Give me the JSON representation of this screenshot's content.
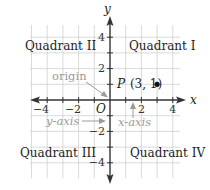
{
  "diagram": {
    "axes": {
      "x_label": "x",
      "y_label": "y",
      "origin_label": "O",
      "x_ticks": [
        {
          "value": -4,
          "label": "−4"
        },
        {
          "value": -2,
          "label": "−2"
        },
        {
          "value": 2,
          "label": "2"
        },
        {
          "value": 4,
          "label": "4"
        }
      ],
      "y_ticks": [
        {
          "value": 4,
          "label": "4"
        },
        {
          "value": 2,
          "label": "2"
        },
        {
          "value": -2,
          "label": "−2"
        },
        {
          "value": -4,
          "label": "−4"
        }
      ],
      "range": {
        "xmin": -5,
        "xmax": 5,
        "ymin": -5,
        "ymax": 5
      }
    },
    "quadrants": {
      "q1": "Quadrant I",
      "q2": "Quadrant II",
      "q3": "Quadrant III",
      "q4": "Quadrant IV"
    },
    "point": {
      "name": "P",
      "coords": "(3, 1)",
      "x": 3,
      "y": 1
    },
    "annotations": {
      "origin": "origin",
      "y_axis": "y-axis",
      "x_axis": "x-axis"
    },
    "colors": {
      "axis": "#333333",
      "grid": "#c8c8c8",
      "text": "#222222",
      "annotation": "#9a9a9a",
      "point": "#111111"
    }
  }
}
